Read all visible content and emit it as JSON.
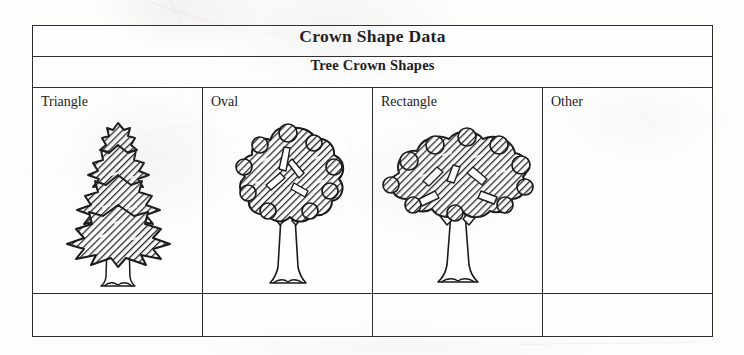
{
  "worksheet": {
    "title": "Crown Shape Data",
    "subtitle": "Tree Crown Shapes",
    "ink_color": "#2d2d2d",
    "paper_color": "#fdfdfc",
    "columns": [
      {
        "label": "Triangle",
        "illustration": "conifer-tree-triangle-crown",
        "tally": ""
      },
      {
        "label": "Oval",
        "illustration": "deciduous-tree-oval-crown",
        "tally": ""
      },
      {
        "label": "Rectangle",
        "illustration": "deciduous-tree-rectangle-crown",
        "tally": ""
      },
      {
        "label": "Other",
        "illustration": "",
        "tally": ""
      }
    ]
  }
}
